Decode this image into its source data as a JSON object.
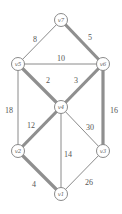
{
  "chart_data": {
    "type": "graph",
    "title": "",
    "directed": false,
    "nodes": [
      {
        "id": "v7",
        "label": "v7",
        "x": 61,
        "y": 20
      },
      {
        "id": "v5",
        "label": "v5",
        "x": 18,
        "y": 64
      },
      {
        "id": "v6",
        "label": "v6",
        "x": 103,
        "y": 64
      },
      {
        "id": "v4",
        "label": "v4",
        "x": 61,
        "y": 107
      },
      {
        "id": "v2",
        "label": "v2",
        "x": 18,
        "y": 151
      },
      {
        "id": "v3",
        "label": "v3",
        "x": 103,
        "y": 151
      },
      {
        "id": "v1",
        "label": "v1",
        "x": 61,
        "y": 194
      }
    ],
    "edges": [
      {
        "from": "v7",
        "to": "v5",
        "weight": "8",
        "highlighted": false,
        "lx": 35,
        "ly": 39
      },
      {
        "from": "v7",
        "to": "v6",
        "weight": "5",
        "highlighted": true,
        "lx": 90,
        "ly": 37
      },
      {
        "from": "v5",
        "to": "v6",
        "weight": "10",
        "highlighted": false,
        "lx": 61,
        "ly": 58
      },
      {
        "from": "v5",
        "to": "v4",
        "weight": "2",
        "highlighted": true,
        "lx": 48,
        "ly": 80
      },
      {
        "from": "v6",
        "to": "v4",
        "weight": "3",
        "highlighted": true,
        "lx": 76,
        "ly": 80
      },
      {
        "from": "v5",
        "to": "v2",
        "weight": "18",
        "highlighted": false,
        "lx": 9,
        "ly": 110
      },
      {
        "from": "v6",
        "to": "v3",
        "weight": "16",
        "highlighted": true,
        "lx": 114,
        "ly": 110
      },
      {
        "from": "v4",
        "to": "v2",
        "weight": "12",
        "highlighted": true,
        "lx": 31,
        "ly": 125
      },
      {
        "from": "v4",
        "to": "v1",
        "weight": "14",
        "highlighted": false,
        "lx": 68,
        "ly": 154
      },
      {
        "from": "v4",
        "to": "v3",
        "weight": "30",
        "highlighted": false,
        "lx": 90,
        "ly": 127
      },
      {
        "from": "v2",
        "to": "v1",
        "weight": "4",
        "highlighted": true,
        "lx": 34,
        "ly": 184
      },
      {
        "from": "v3",
        "to": "v1",
        "weight": "26",
        "highlighted": false,
        "lx": 89,
        "ly": 182
      }
    ]
  },
  "colors": {
    "edge": "#8a8a8a",
    "highlighted_edge": "#8f8f8f",
    "node_fill": "#ffffff",
    "text": "#555555"
  }
}
